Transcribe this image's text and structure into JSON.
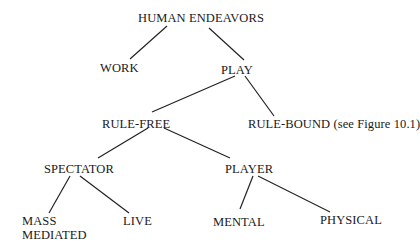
{
  "diagram": {
    "type": "tree",
    "nodes": {
      "root": {
        "label": "HUMAN ENDEAVORS"
      },
      "work": {
        "label": "WORK"
      },
      "play": {
        "label": "PLAY"
      },
      "rule_free": {
        "label": "RULE-FREE"
      },
      "rule_bound": {
        "label": "RULE-BOUND (see Figure 10.1)"
      },
      "spectator": {
        "label": "SPECTATOR"
      },
      "player": {
        "label": "PLAYER"
      },
      "mass_mediated": {
        "label_line1": "MASS",
        "label_line2": "MEDIATED"
      },
      "live": {
        "label": "LIVE"
      },
      "mental": {
        "label": "MENTAL"
      },
      "physical": {
        "label": "PHYSICAL"
      }
    },
    "edges": [
      {
        "from": "HUMAN ENDEAVORS",
        "to": "WORK"
      },
      {
        "from": "HUMAN ENDEAVORS",
        "to": "PLAY"
      },
      {
        "from": "PLAY",
        "to": "RULE-FREE"
      },
      {
        "from": "PLAY",
        "to": "RULE-BOUND (see Figure 10.1)"
      },
      {
        "from": "RULE-FREE",
        "to": "SPECTATOR"
      },
      {
        "from": "RULE-FREE",
        "to": "PLAYER"
      },
      {
        "from": "SPECTATOR",
        "to": "MASS MEDIATED"
      },
      {
        "from": "SPECTATOR",
        "to": "LIVE"
      },
      {
        "from": "PLAYER",
        "to": "MENTAL"
      },
      {
        "from": "PLAYER",
        "to": "PHYSICAL"
      }
    ],
    "colors": {
      "text": "#1a1a1a",
      "lines": "#222222",
      "background": "#ffffff"
    }
  }
}
